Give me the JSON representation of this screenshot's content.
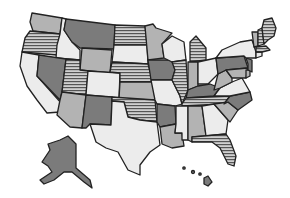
{
  "map": {
    "title": "United States",
    "fills": {
      "light": "#ececec",
      "medium": "#b3b3b3",
      "dark": "#7b7b7b",
      "stripes": "horizontal-stripes"
    },
    "states": [
      {
        "id": "WA",
        "fill": "medium"
      },
      {
        "id": "OR",
        "fill": "stripes"
      },
      {
        "id": "CA",
        "fill": "light"
      },
      {
        "id": "ID",
        "fill": "light"
      },
      {
        "id": "NV",
        "fill": "dark"
      },
      {
        "id": "MT",
        "fill": "dark"
      },
      {
        "id": "WY",
        "fill": "medium"
      },
      {
        "id": "UT",
        "fill": "stripes"
      },
      {
        "id": "AZ",
        "fill": "medium"
      },
      {
        "id": "CO",
        "fill": "light"
      },
      {
        "id": "NM",
        "fill": "dark"
      },
      {
        "id": "ND",
        "fill": "stripes"
      },
      {
        "id": "SD",
        "fill": "light"
      },
      {
        "id": "NE",
        "fill": "stripes"
      },
      {
        "id": "KS",
        "fill": "medium"
      },
      {
        "id": "OK",
        "fill": "stripes"
      },
      {
        "id": "TX",
        "fill": "light"
      },
      {
        "id": "MN",
        "fill": "medium"
      },
      {
        "id": "IA",
        "fill": "dark"
      },
      {
        "id": "MO",
        "fill": "light"
      },
      {
        "id": "AR",
        "fill": "dark"
      },
      {
        "id": "LA",
        "fill": "medium"
      },
      {
        "id": "WI",
        "fill": "light"
      },
      {
        "id": "IL",
        "fill": "stripes"
      },
      {
        "id": "MI",
        "fill": "stripes"
      },
      {
        "id": "IN",
        "fill": "medium"
      },
      {
        "id": "OH",
        "fill": "light"
      },
      {
        "id": "KY",
        "fill": "dark"
      },
      {
        "id": "TN",
        "fill": "stripes"
      },
      {
        "id": "MS",
        "fill": "light"
      },
      {
        "id": "AL",
        "fill": "medium"
      },
      {
        "id": "GA",
        "fill": "light"
      },
      {
        "id": "FL",
        "fill": "stripes"
      },
      {
        "id": "WV",
        "fill": "medium"
      },
      {
        "id": "VA",
        "fill": "light"
      },
      {
        "id": "NC",
        "fill": "dark"
      },
      {
        "id": "SC",
        "fill": "medium"
      },
      {
        "id": "PA",
        "fill": "dark"
      },
      {
        "id": "NY",
        "fill": "light"
      },
      {
        "id": "NJ",
        "fill": "dark"
      },
      {
        "id": "VT",
        "fill": "medium"
      },
      {
        "id": "NH",
        "fill": "stripes"
      },
      {
        "id": "ME",
        "fill": "stripes"
      },
      {
        "id": "MA",
        "fill": "stripes"
      },
      {
        "id": "CT",
        "fill": "light"
      },
      {
        "id": "DE",
        "fill": "medium"
      },
      {
        "id": "MD",
        "fill": "medium"
      },
      {
        "id": "AK",
        "fill": "dark"
      },
      {
        "id": "HI",
        "fill": "dark"
      }
    ]
  }
}
